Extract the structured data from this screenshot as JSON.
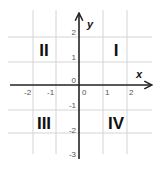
{
  "diagram": {
    "title": "",
    "type": "cartesian-plane-quadrants",
    "axes": {
      "x_label": "x",
      "y_label": "y",
      "x_ticks": [
        "-2",
        "-1",
        "0",
        "1",
        "2"
      ],
      "y_ticks": [
        "2",
        "1",
        "0",
        "-1",
        "-2",
        "-3"
      ]
    },
    "quadrants": {
      "I": "I",
      "II": "II",
      "III": "III",
      "IV": "IV"
    },
    "colors": {
      "grid": "#d4d4d4",
      "axis": "#222222",
      "text": "#111111",
      "tick_text": "#555555"
    }
  }
}
